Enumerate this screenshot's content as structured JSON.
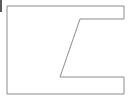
{
  "canvas": {
    "width": 132,
    "height": 101,
    "background_color": "#ffffff",
    "title": "C-shaped polygon line drawing"
  },
  "diagram": {
    "name": "notched-rectangle",
    "stroke_color": "#8c8c8c",
    "fill_color": "#ffffff",
    "stroke_width": 1,
    "bounds": {
      "left": 7,
      "top": 6,
      "right": 124,
      "bottom": 94,
      "width": 117,
      "height": 88
    },
    "vertices": [
      {
        "name": "top-left",
        "x": 7,
        "y": 6
      },
      {
        "name": "top-right",
        "x": 124,
        "y": 6
      },
      {
        "name": "notch-upper-right",
        "x": 124,
        "y": 19
      },
      {
        "name": "notch-upper-inner",
        "x": 80,
        "y": 19
      },
      {
        "name": "notch-lower-inner",
        "x": 60,
        "y": 77
      },
      {
        "name": "notch-lower-right",
        "x": 124,
        "y": 77
      },
      {
        "name": "bottom-right",
        "x": 124,
        "y": 94
      },
      {
        "name": "bottom-left",
        "x": 7,
        "y": 94
      }
    ],
    "path_d": "M 7 6 L 124 6 L 124 19 L 80 19 L 60 77 L 124 77 L 124 94 L 7 94 Z",
    "vertex_count": 8
  },
  "edge_marker": {
    "name": "left-edge-tick",
    "color": "#5a5a5a",
    "x": 0,
    "y": 0,
    "width": 2,
    "height": 12
  }
}
